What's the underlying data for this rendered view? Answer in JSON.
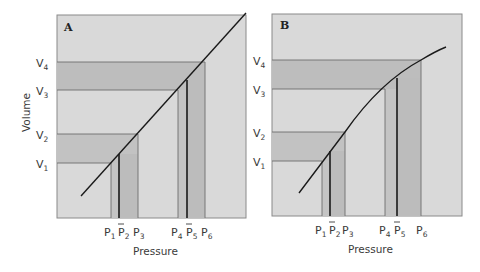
{
  "figure": {
    "panels": [
      {
        "id": "A",
        "label": "A",
        "curve": "linear",
        "y_labels": [
          "V4",
          "V3",
          "V2",
          "V1"
        ],
        "x_labels": [
          "P1",
          "P̄2",
          "P3",
          "P4",
          "P̄5",
          "P6"
        ]
      },
      {
        "id": "B",
        "label": "B",
        "curve": "concave-down",
        "y_labels": [
          "V4",
          "V3",
          "V2",
          "V1"
        ],
        "x_labels": [
          "P1",
          "P̄2",
          "P3",
          "P4",
          "P̄5",
          "P6"
        ]
      }
    ],
    "y_axis_title": "Volume",
    "x_axis_title_A": "Pressure",
    "x_axis_title_B": "Pressure",
    "colors": {
      "background": "#d9d9d9",
      "band_dark": "#b8b8b8",
      "band_mid": "#c6c6c6",
      "grid_line": "#6e6e6e",
      "curve": "#1a1a1a",
      "border": "#8a8a8a"
    }
  },
  "labels": {
    "panel_a": "A",
    "panel_b": "B",
    "volume": "Volume",
    "pressure_a": "Pressure",
    "pressure_b": "Pressure",
    "v": "V",
    "p": "P",
    "sub1": "1",
    "sub2": "2",
    "sub3": "3",
    "sub4": "4",
    "sub5": "5",
    "sub6": "6"
  }
}
